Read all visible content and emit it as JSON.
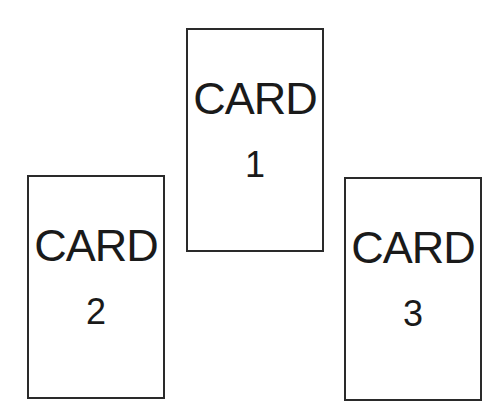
{
  "cards": [
    {
      "title": "CARD",
      "number": "1"
    },
    {
      "title": "CARD",
      "number": "2"
    },
    {
      "title": "CARD",
      "number": "3"
    }
  ]
}
